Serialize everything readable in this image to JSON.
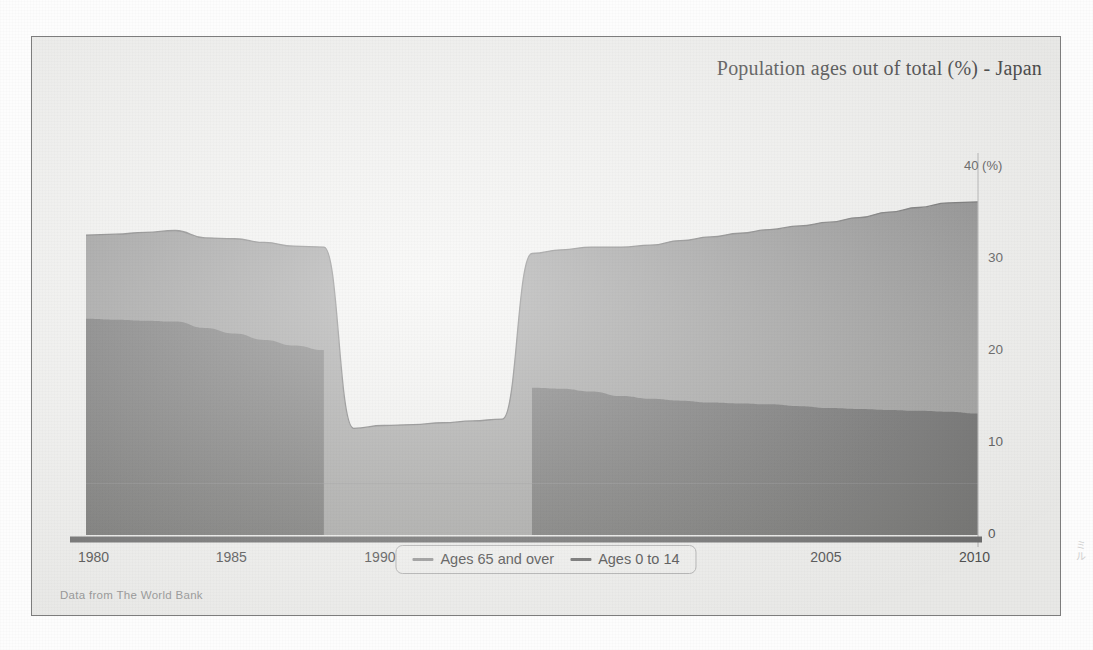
{
  "chart": {
    "title": "Population ages out of total (%) - Japan",
    "source_note": "Data from The World Bank",
    "y_unit_label": "40 (%)",
    "legend": [
      {
        "label": "Ages 65 and over",
        "color": "#9a9a9a"
      },
      {
        "label": "Ages 0 to 14",
        "color": "#6e6e6e"
      }
    ]
  },
  "chart_data": {
    "type": "area",
    "stacked": true,
    "title": "Population ages out of total (%) - Japan",
    "xlabel": "",
    "ylabel": "(%)",
    "xlim": [
      1980,
      2010
    ],
    "ylim": [
      0,
      40
    ],
    "yticks": [
      0,
      10,
      20,
      30,
      40
    ],
    "ytick_labels": [
      "0",
      "10",
      "20",
      "30",
      "40 (%)"
    ],
    "xticks": [
      1980,
      1985,
      1990,
      1995,
      2000,
      2005,
      2010
    ],
    "xtick_labels": [
      "1980",
      "1985",
      "1990",
      "1995",
      "2000",
      "2005",
      "2010"
    ],
    "grid": false,
    "legend_position": "bottom-center",
    "annotations": [
      "Data from The World Bank"
    ],
    "missing_data_range": [
      1989,
      1994
    ],
    "missing_data_note": "Ages 0 to 14 series absent 1989-1994; total line drops to the Ages 65 and over values only",
    "x": [
      1980,
      1981,
      1982,
      1983,
      1984,
      1985,
      1986,
      1987,
      1988,
      1989,
      1990,
      1991,
      1992,
      1993,
      1994,
      1995,
      1996,
      1997,
      1998,
      1999,
      2000,
      2001,
      2002,
      2003,
      2004,
      2005,
      2006,
      2007,
      2008,
      2009,
      2010
    ],
    "series": [
      {
        "name": "Ages 0 to 14",
        "color": "#6e6e6e",
        "values": [
          23.5,
          23.4,
          23.3,
          23.2,
          22.5,
          21.9,
          21.2,
          20.6,
          20.1,
          null,
          null,
          null,
          null,
          null,
          null,
          16.0,
          15.9,
          15.6,
          15.1,
          14.8,
          14.6,
          14.4,
          14.3,
          14.2,
          14.0,
          13.8,
          13.7,
          13.6,
          13.5,
          13.4,
          13.2
        ]
      },
      {
        "name": "Ages 65 and over",
        "color": "#9a9a9a",
        "values": [
          9.1,
          9.3,
          9.6,
          9.9,
          9.8,
          10.3,
          10.6,
          10.8,
          11.2,
          11.6,
          11.9,
          12.0,
          12.2,
          12.4,
          12.6,
          14.6,
          15.1,
          15.7,
          16.2,
          16.7,
          17.4,
          18.0,
          18.5,
          19.0,
          19.6,
          20.2,
          20.8,
          21.5,
          22.1,
          22.7,
          23.0
        ]
      }
    ],
    "stack_total": [
      32.6,
      32.7,
      32.9,
      33.1,
      32.3,
      32.2,
      31.8,
      31.4,
      31.3,
      11.6,
      11.9,
      12.0,
      12.2,
      12.4,
      12.6,
      30.6,
      31.0,
      31.3,
      31.3,
      31.5,
      32.0,
      32.4,
      32.8,
      33.2,
      33.6,
      34.0,
      34.5,
      35.1,
      35.6,
      36.1,
      36.2
    ]
  }
}
